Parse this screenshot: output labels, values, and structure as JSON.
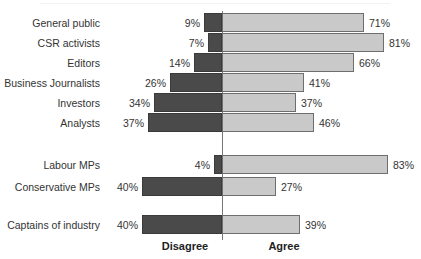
{
  "chart_data": {
    "type": "bar",
    "subtype": "diverging-horizontal-bar",
    "title": "",
    "xlabel": "",
    "ylabel": "",
    "legend_position": "bottom",
    "grid": false,
    "axis_zero_label": "0",
    "series": [
      {
        "name": "Disagree",
        "side": "left",
        "color": "#4a4a4a"
      },
      {
        "name": "Agree",
        "side": "right",
        "color": "#c9c9c9"
      }
    ],
    "categories": [
      "General public",
      "CSR activists",
      "Editors",
      "Business Journalists",
      "Investors",
      "Analysts",
      "Labour MPs",
      "Conservative MPs",
      "Captains of industry"
    ],
    "groups": [
      {
        "rows": [
          0,
          1,
          2,
          3,
          4,
          5
        ]
      },
      {
        "rows": [
          6,
          7
        ]
      },
      {
        "rows": [
          8
        ]
      }
    ],
    "disagree_values": [
      9,
      7,
      14,
      26,
      34,
      37,
      4,
      40,
      40
    ],
    "agree_values": [
      71,
      81,
      66,
      41,
      37,
      46,
      83,
      27,
      39
    ],
    "disagree_labels": [
      "9%",
      "7%",
      "14%",
      "26%",
      "34%",
      "37%",
      "4%",
      "40%",
      "40%"
    ],
    "agree_labels": [
      "71%",
      "81%",
      "66%",
      "41%",
      "37%",
      "46%",
      "83%",
      "27%",
      "39%"
    ],
    "xlim": [
      -45,
      90
    ],
    "units": "percent"
  },
  "rows": [
    {
      "label": "General public",
      "disagree": "9%",
      "agree": "71%",
      "disagree_value": 9,
      "agree_value": 71,
      "top": 13
    },
    {
      "label": "CSR activists",
      "disagree": "7%",
      "agree": "81%",
      "disagree_value": 7,
      "agree_value": 81,
      "top": 33
    },
    {
      "label": "Editors",
      "disagree": "14%",
      "agree": "66%",
      "disagree_value": 14,
      "agree_value": 66,
      "top": 53
    },
    {
      "label": "Business Journalists",
      "disagree": "26%",
      "agree": "41%",
      "disagree_value": 26,
      "agree_value": 41,
      "top": 73
    },
    {
      "label": "Investors",
      "disagree": "34%",
      "agree": "37%",
      "disagree_value": 34,
      "agree_value": 37,
      "top": 93
    },
    {
      "label": "Analysts",
      "disagree": "37%",
      "agree": "46%",
      "disagree_value": 37,
      "agree_value": 46,
      "top": 113
    },
    {
      "label": "Labour MPs",
      "disagree": "4%",
      "agree": "83%",
      "disagree_value": 4,
      "agree_value": 83,
      "top": 155
    },
    {
      "label": "Conservative MPs",
      "disagree": "40%",
      "agree": "27%",
      "disagree_value": 40,
      "agree_value": 27,
      "top": 177
    },
    {
      "label": "Captains of industry",
      "disagree": "40%",
      "agree": "39%",
      "disagree_value": 40,
      "agree_value": 39,
      "top": 215
    }
  ],
  "legend": {
    "disagree": "Disagree",
    "agree": "Agree"
  },
  "colors": {
    "disagree_fill": "#4a4a4a",
    "agree_fill": "#c9c9c9",
    "bar_stroke": "#6e6e6e",
    "axis": "#777777",
    "text": "#333333"
  },
  "geometry": {
    "zero_x": 222,
    "px_per_percent": 2.0,
    "bar_height": 19,
    "axis_top": 11,
    "axis_bottom": 240
  }
}
